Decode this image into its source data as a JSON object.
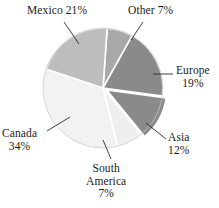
{
  "chart_data": {
    "type": "pie",
    "title": "",
    "labels": [
      "Other",
      "Europe",
      "Asia",
      "South America",
      "Canada",
      "Mexico"
    ],
    "values": [
      7,
      19,
      12,
      7,
      34,
      21
    ],
    "unit": "%",
    "total": 100,
    "legend": "none",
    "start_angle_deg": -86,
    "direction": "clockwise",
    "exploded_slices": [
      "Asia"
    ],
    "slice_colors": [
      "#a8a8a8",
      "#8a8a8a",
      "#8a8a8a",
      "#efefef",
      "#f2f2f2",
      "#bdbdbd"
    ],
    "separator_color": "#ffffff",
    "outline_color": "#b5b5b5",
    "slices": [
      {
        "label": "Other",
        "value": 7,
        "color": "#a8a8a8"
      },
      {
        "label": "Europe",
        "value": 19,
        "color": "#8a8a8a"
      },
      {
        "label": "Asia",
        "value": 12,
        "color": "#8a8a8a"
      },
      {
        "label": "South America",
        "value": 7,
        "color": "#efefef"
      },
      {
        "label": "Canada",
        "value": 34,
        "color": "#f2f2f2"
      },
      {
        "label": "Mexico",
        "value": 21,
        "color": "#bdbdbd"
      }
    ]
  },
  "labels": {
    "mexico": {
      "text": "Mexico 21%"
    },
    "other": {
      "text": "Other 7%"
    },
    "europe": {
      "line1": "Europe",
      "line2": "19%"
    },
    "asia": {
      "line1": "Asia",
      "line2": "12%"
    },
    "canada": {
      "line1": "Canada",
      "line2": "34%"
    },
    "south_america": {
      "line1": "South",
      "line2": "America",
      "line3": "7%"
    }
  }
}
